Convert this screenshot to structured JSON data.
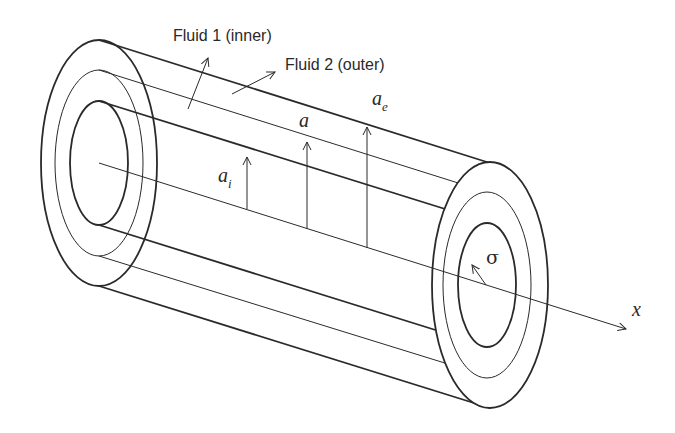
{
  "diagram": {
    "labels": {
      "fluid_inner": "Fluid 1 (inner)",
      "fluid_outer": "Fluid 2 (outer)",
      "radius_inner": "a",
      "radius_inner_sub": "i",
      "radius_interface": "a",
      "radius_outer": "a",
      "radius_outer_sub": "e",
      "surface_tension": "σ",
      "axis": "x"
    },
    "colors": {
      "stroke": "#2a2a2a",
      "background": "#ffffff"
    }
  }
}
